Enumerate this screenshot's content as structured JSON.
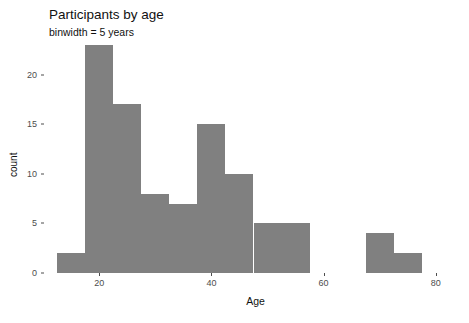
{
  "chart_data": {
    "type": "bar",
    "title": "Participants by age",
    "subtitle": "binwidth = 5 years",
    "xlabel": "Age",
    "ylabel": "count",
    "xlim": [
      10.5,
      84.5
    ],
    "ylim": [
      0,
      23
    ],
    "grid": false,
    "legend": "none",
    "binwidth": 5,
    "bar_color": "#808080",
    "panel_background": "#ffffff",
    "axis_text_color": "#4d4d4d",
    "x_ticks": [
      {
        "value": 20,
        "label": "20"
      },
      {
        "value": 40,
        "label": "40"
      },
      {
        "value": 60,
        "label": "60"
      },
      {
        "value": 80,
        "label": "80"
      }
    ],
    "y_ticks": [
      {
        "value": 0,
        "label": "0"
      },
      {
        "value": 5,
        "label": "5"
      },
      {
        "value": 10,
        "label": "10"
      },
      {
        "value": 15,
        "label": "15"
      },
      {
        "value": 20,
        "label": "20"
      }
    ],
    "bins": [
      {
        "x_start": 12.5,
        "x_end": 17.5,
        "center": 15,
        "count": 2
      },
      {
        "x_start": 17.5,
        "x_end": 22.5,
        "center": 20,
        "count": 23
      },
      {
        "x_start": 22.5,
        "x_end": 27.5,
        "center": 25,
        "count": 17
      },
      {
        "x_start": 27.5,
        "x_end": 32.5,
        "center": 30,
        "count": 8
      },
      {
        "x_start": 32.5,
        "x_end": 37.5,
        "center": 35,
        "count": 7
      },
      {
        "x_start": 37.5,
        "x_end": 42.5,
        "center": 40,
        "count": 15
      },
      {
        "x_start": 42.5,
        "x_end": 47.5,
        "center": 45,
        "count": 10
      },
      {
        "x_start": 47.5,
        "x_end": 52.5,
        "center": 50,
        "count": 5
      },
      {
        "x_start": 52.5,
        "x_end": 57.5,
        "center": 55,
        "count": 5
      },
      {
        "x_start": 67.5,
        "x_end": 72.5,
        "center": 70,
        "count": 4
      },
      {
        "x_start": 72.5,
        "x_end": 77.5,
        "center": 75,
        "count": 2
      }
    ],
    "categories": [
      "15",
      "20",
      "25",
      "30",
      "35",
      "40",
      "45",
      "50",
      "55",
      "70",
      "75"
    ],
    "values": [
      2,
      23,
      17,
      8,
      7,
      15,
      10,
      5,
      5,
      4,
      2
    ]
  }
}
